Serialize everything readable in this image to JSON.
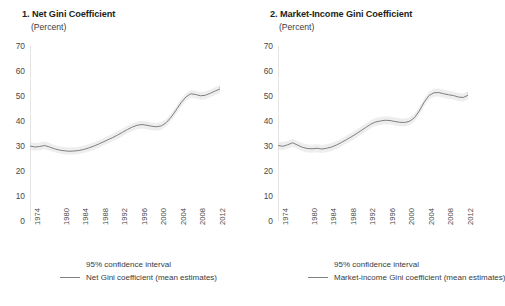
{
  "figure": {
    "width": 496,
    "height": 306,
    "background": "#ffffff"
  },
  "chart_data": [
    {
      "type": "line",
      "title": "1. Net Gini Coefficient",
      "subtitle": "(Percent)",
      "panel_number": "1.",
      "ylabel": "(Percent)",
      "xlabel": "",
      "ylim": [
        0,
        70
      ],
      "yticks": [
        0,
        10,
        20,
        30,
        40,
        50,
        60,
        70
      ],
      "ytick_labels": [
        "0",
        "10",
        "20",
        "30",
        "40",
        "50",
        "60",
        "70"
      ],
      "xlim": [
        1974,
        2013
      ],
      "xticks": [
        1974,
        1980,
        1984,
        1988,
        1992,
        1996,
        2000,
        2004,
        2008,
        2012
      ],
      "xtick_labels": [
        "1974",
        "1980",
        "1984",
        "1988",
        "1992",
        "1996",
        "2000",
        "2004",
        "2008",
        "2012"
      ],
      "grid": false,
      "legend_position": "bottom",
      "line_color": "#808080",
      "band_color": "#d9d9d9",
      "legend": [
        {
          "label": "95% confidence interval",
          "marker": "band"
        },
        {
          "label": "Net Gini coefficient (mean estimates)",
          "marker": "line"
        }
      ],
      "series": [
        {
          "name": "Net Gini coefficient (mean estimates)",
          "x": [
            1974,
            1975,
            1976,
            1977,
            1978,
            1979,
            1980,
            1981,
            1982,
            1983,
            1984,
            1985,
            1986,
            1987,
            1988,
            1989,
            1990,
            1991,
            1992,
            1993,
            1994,
            1995,
            1996,
            1997,
            1998,
            1999,
            2000,
            2001,
            2002,
            2003,
            2004,
            2005,
            2006,
            2007,
            2008,
            2009,
            2010,
            2011,
            2012,
            2013
          ],
          "values": [
            30.0,
            29.6,
            29.8,
            30.2,
            29.6,
            28.9,
            28.4,
            28.1,
            27.9,
            28.0,
            28.2,
            28.6,
            29.2,
            29.9,
            30.7,
            31.6,
            32.5,
            33.4,
            34.4,
            35.5,
            36.6,
            37.6,
            38.3,
            38.6,
            38.3,
            37.9,
            37.7,
            38.1,
            39.4,
            41.6,
            44.4,
            47.3,
            49.6,
            50.9,
            50.6,
            50.1,
            50.3,
            51.1,
            52.0,
            52.8
          ],
          "band_lower": [
            28.4,
            28.1,
            28.3,
            28.7,
            28.1,
            27.5,
            27.0,
            26.7,
            26.5,
            26.6,
            26.8,
            27.2,
            27.7,
            28.4,
            29.2,
            30.1,
            31.0,
            31.9,
            32.9,
            33.9,
            35.0,
            36.0,
            36.7,
            37.0,
            36.7,
            36.3,
            36.1,
            36.5,
            37.8,
            40.0,
            42.8,
            45.7,
            48.0,
            49.3,
            49.0,
            48.5,
            48.7,
            49.5,
            50.4,
            51.2
          ],
          "band_upper": [
            31.6,
            31.2,
            31.4,
            31.8,
            31.2,
            30.4,
            29.9,
            29.6,
            29.4,
            29.5,
            29.7,
            30.1,
            30.7,
            31.4,
            32.2,
            33.1,
            34.0,
            34.9,
            35.9,
            37.0,
            38.1,
            39.1,
            39.8,
            40.1,
            39.8,
            39.4,
            39.2,
            39.6,
            40.9,
            43.1,
            45.9,
            48.8,
            51.1,
            52.4,
            52.1,
            51.6,
            51.8,
            52.6,
            53.5,
            54.3
          ]
        },
        {
          "name": "Net Gini coefficient plateau",
          "x": [
            2013,
            2014
          ],
          "values": [
            53.4,
            53.5
          ],
          "band_lower": [
            51.8,
            51.9
          ],
          "band_upper": [
            54.9,
            55.0
          ]
        }
      ]
    },
    {
      "type": "line",
      "title": "2. Market-Income Gini Coefficient",
      "subtitle": "(Percent)",
      "panel_number": "2.",
      "ylabel": "(Percent)",
      "xlabel": "",
      "ylim": [
        0,
        70
      ],
      "yticks": [
        0,
        10,
        20,
        30,
        40,
        50,
        60,
        70
      ],
      "ytick_labels": [
        "0",
        "10",
        "20",
        "30",
        "40",
        "50",
        "60",
        "70"
      ],
      "xlim": [
        1974,
        2013
      ],
      "xticks": [
        1974,
        1980,
        1984,
        1988,
        1992,
        1996,
        2000,
        2004,
        2008,
        2012
      ],
      "xtick_labels": [
        "1974",
        "1980",
        "1984",
        "1988",
        "1992",
        "1996",
        "2000",
        "2004",
        "2008",
        "2012"
      ],
      "grid": false,
      "legend_position": "bottom",
      "line_color": "#808080",
      "band_color": "#d9d9d9",
      "legend": [
        {
          "label": "95% confidence interval",
          "marker": "band"
        },
        {
          "label": "Market-income Gini coefficient (mean estimates)",
          "marker": "line"
        }
      ],
      "series": [
        {
          "name": "Market-income Gini coefficient (mean estimates)",
          "x": [
            1974,
            1975,
            1976,
            1977,
            1978,
            1979,
            1980,
            1981,
            1982,
            1983,
            1984,
            1985,
            1986,
            1987,
            1988,
            1989,
            1990,
            1991,
            1992,
            1993,
            1994,
            1995,
            1996,
            1997,
            1998,
            1999,
            2000,
            2001,
            2002,
            2003,
            2004,
            2005,
            2006,
            2007,
            2008,
            2009,
            2010,
            2011,
            2012,
            2013
          ],
          "values": [
            30.2,
            29.9,
            30.5,
            31.3,
            30.4,
            29.5,
            29.0,
            28.9,
            29.1,
            28.8,
            29.1,
            29.6,
            30.4,
            31.4,
            32.5,
            33.6,
            34.8,
            36.1,
            37.4,
            38.7,
            39.6,
            40.0,
            40.3,
            40.2,
            39.8,
            39.5,
            39.4,
            39.9,
            41.3,
            44.0,
            47.5,
            50.2,
            51.3,
            51.4,
            50.9,
            50.5,
            50.2,
            49.6,
            49.4,
            50.3
          ],
          "band_lower": [
            28.6,
            28.3,
            28.9,
            29.7,
            28.8,
            27.9,
            27.4,
            27.3,
            27.5,
            27.2,
            27.5,
            28.0,
            28.8,
            29.8,
            30.9,
            32.0,
            33.2,
            34.5,
            35.8,
            37.1,
            38.0,
            38.4,
            38.7,
            38.6,
            38.2,
            37.9,
            37.8,
            38.3,
            39.7,
            42.4,
            45.9,
            48.6,
            49.7,
            49.8,
            49.3,
            48.9,
            48.6,
            48.0,
            47.8,
            48.7
          ],
          "band_upper": [
            31.8,
            31.5,
            32.1,
            32.9,
            32.0,
            31.1,
            30.6,
            30.5,
            30.7,
            30.4,
            30.7,
            31.2,
            32.0,
            33.0,
            34.1,
            35.2,
            36.4,
            37.7,
            39.0,
            40.3,
            41.2,
            41.6,
            41.9,
            41.8,
            41.4,
            41.1,
            41.0,
            41.5,
            42.9,
            45.6,
            49.1,
            51.8,
            52.9,
            53.0,
            52.5,
            52.1,
            51.8,
            51.2,
            51.0,
            51.9
          ]
        },
        {
          "name": "Market-income tail",
          "x": [
            2013,
            2014
          ],
          "values": [
            51.2,
            51.9
          ],
          "band_lower": [
            49.6,
            50.3
          ],
          "band_upper": [
            52.8,
            53.5
          ]
        }
      ]
    }
  ]
}
